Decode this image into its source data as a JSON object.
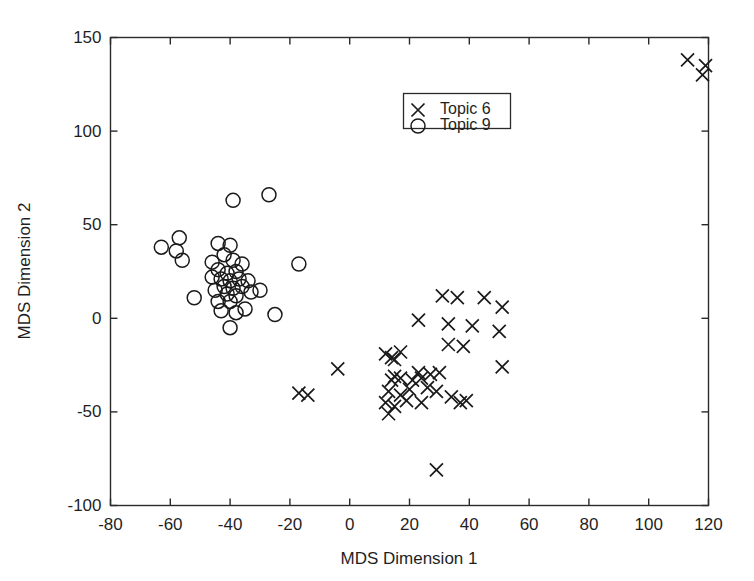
{
  "chart_data": {
    "type": "scatter",
    "title": "",
    "xlabel": "MDS Dimension 1",
    "ylabel": "MDS Dimension 2",
    "xlim": [
      -80,
      120
    ],
    "ylim": [
      -100,
      150
    ],
    "xticks": [
      -80,
      -60,
      -40,
      -20,
      0,
      20,
      40,
      60,
      80,
      100,
      120
    ],
    "yticks": [
      -100,
      -50,
      0,
      50,
      100,
      150
    ],
    "xtick_labels": [
      "-80",
      "-60",
      "-40",
      "-20",
      "0",
      "20",
      "40",
      "60",
      "80",
      "100",
      "120"
    ],
    "ytick_labels": [
      "-100",
      "-50",
      "0",
      "50",
      "100",
      "150"
    ],
    "grid": false,
    "legend_position": "upper center",
    "series": [
      {
        "name": "Topic 6",
        "marker": "x",
        "color": "#1a1a1a",
        "points": [
          [
            113,
            138
          ],
          [
            119,
            135
          ],
          [
            118,
            130
          ],
          [
            31,
            12
          ],
          [
            36,
            11
          ],
          [
            45,
            11
          ],
          [
            51,
            6
          ],
          [
            23,
            -1
          ],
          [
            33,
            -3
          ],
          [
            41,
            -4
          ],
          [
            50,
            -7
          ],
          [
            33,
            -14
          ],
          [
            38,
            -15
          ],
          [
            12,
            -19
          ],
          [
            14,
            -21
          ],
          [
            15,
            -22
          ],
          [
            17,
            -18
          ],
          [
            51,
            -26
          ],
          [
            -4,
            -27
          ],
          [
            23,
            -29
          ],
          [
            27,
            -30
          ],
          [
            30,
            -29
          ],
          [
            24,
            -32
          ],
          [
            21,
            -33
          ],
          [
            17,
            -32
          ],
          [
            15,
            -31
          ],
          [
            14,
            -33
          ],
          [
            -17,
            -40
          ],
          [
            -14,
            -41
          ],
          [
            13,
            -39
          ],
          [
            17,
            -41
          ],
          [
            20,
            -38
          ],
          [
            26,
            -37
          ],
          [
            29,
            -39
          ],
          [
            12,
            -45
          ],
          [
            15,
            -47
          ],
          [
            19,
            -44
          ],
          [
            24,
            -45
          ],
          [
            34,
            -42
          ],
          [
            37,
            -45
          ],
          [
            39,
            -44
          ],
          [
            13,
            -51
          ],
          [
            29,
            -81
          ]
        ]
      },
      {
        "name": "Topic 9",
        "marker": "o",
        "color": "#1a1a1a",
        "points": [
          [
            -39,
            63
          ],
          [
            -27,
            66
          ],
          [
            -63,
            38
          ],
          [
            -58,
            36
          ],
          [
            -57,
            43
          ],
          [
            -56,
            31
          ],
          [
            -44,
            40
          ],
          [
            -40,
            39
          ],
          [
            -42,
            34
          ],
          [
            -46,
            30
          ],
          [
            -39,
            31
          ],
          [
            -36,
            29
          ],
          [
            -44,
            26
          ],
          [
            -41,
            24
          ],
          [
            -38,
            25
          ],
          [
            -43,
            21
          ],
          [
            -40,
            20
          ],
          [
            -37,
            21
          ],
          [
            -46,
            22
          ],
          [
            -42,
            17
          ],
          [
            -39,
            16
          ],
          [
            -36,
            17
          ],
          [
            -45,
            15
          ],
          [
            -41,
            13
          ],
          [
            -38,
            12
          ],
          [
            -34,
            20
          ],
          [
            -33,
            14
          ],
          [
            -30,
            15
          ],
          [
            -52,
            11
          ],
          [
            -44,
            9
          ],
          [
            -40,
            9
          ],
          [
            -17,
            29
          ],
          [
            -43,
            4
          ],
          [
            -38,
            3
          ],
          [
            -35,
            5
          ],
          [
            -25,
            2
          ],
          [
            -40,
            -5
          ]
        ]
      }
    ]
  },
  "legend": {
    "entries": [
      {
        "label": "Topic 6",
        "marker": "x"
      },
      {
        "label": "Topic 9",
        "marker": "o"
      }
    ]
  }
}
